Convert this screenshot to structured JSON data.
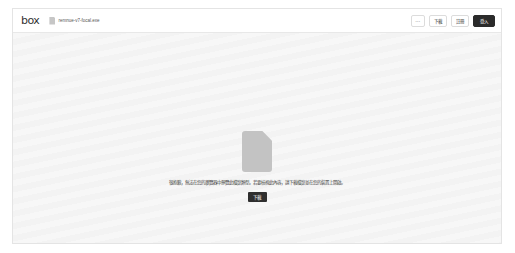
{
  "header": {
    "logo": "box",
    "file_icon": "file-icon",
    "file_name": "remnue-v7-focal.exe",
    "actions": {
      "more_label": "⋯",
      "download_label": "下載",
      "signup_label": "註冊",
      "login_label": "登入"
    }
  },
  "preview": {
    "icon": "file-icon",
    "message": "很抱歉，無法在您的瀏覽器中預覽此檔案類型。若要檢視此內容，請下載檔案並在您的裝置上開啟。",
    "download_label": "下載"
  },
  "colors": {
    "primary_button": "#2b2b2b",
    "file_icon": "#c3c3c3",
    "border": "#e4e4e4"
  }
}
